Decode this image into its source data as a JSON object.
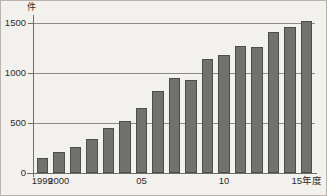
{
  "chart_data": {
    "type": "bar",
    "title": "",
    "subtitle": "",
    "unit_label": "件",
    "xlabel": "年度",
    "ylabel": "件",
    "ylim": [
      0,
      1600
    ],
    "yticks": [
      0,
      500,
      1000,
      1500
    ],
    "ytick_labels": [
      "0",
      "500",
      "1000",
      "1500"
    ],
    "grid": "horizontal",
    "legend": "none",
    "bar_color": "#72726c",
    "bar_edge_color": "#4d4d49",
    "background_color": "#f3f1ed",
    "axis_color": "#6f6d68",
    "categories": [
      "1999",
      "2000",
      "2001",
      "2002",
      "2003",
      "2004",
      "2005",
      "2006",
      "2007",
      "2008",
      "2009",
      "2010",
      "2011",
      "2012",
      "2013",
      "2014",
      "2015"
    ],
    "xtick_labels": [
      {
        "category": "1999",
        "label": "1999"
      },
      {
        "category": "2000",
        "label": "2000"
      },
      {
        "category": "2005",
        "label": "05"
      },
      {
        "category": "2010",
        "label": "10"
      },
      {
        "category": "2015",
        "label": "15年度"
      }
    ],
    "values": [
      150,
      210,
      265,
      345,
      455,
      525,
      655,
      820,
      955,
      935,
      1145,
      1185,
      1275,
      1260,
      1415,
      1465,
      1520
    ]
  }
}
